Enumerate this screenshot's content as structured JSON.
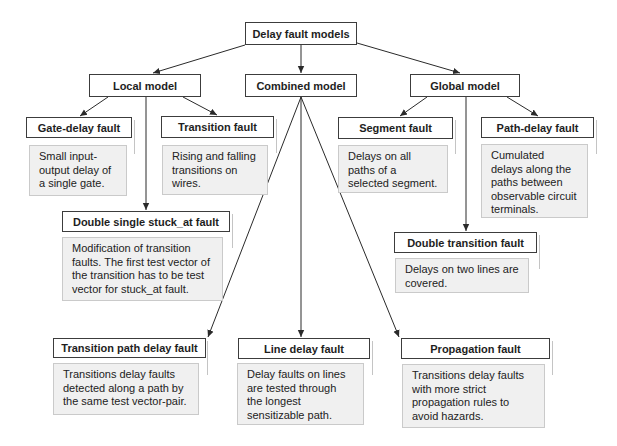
{
  "diagram": {
    "root": {
      "title": "Delay fault models"
    },
    "level1": {
      "local": {
        "title": "Local model"
      },
      "combined": {
        "title": "Combined model"
      },
      "global": {
        "title": "Global model"
      }
    },
    "faults": {
      "gate_delay": {
        "title": "Gate-delay fault",
        "parent": "Local model",
        "description_lines": [
          "Small input-",
          "output delay of",
          "a single gate."
        ]
      },
      "transition": {
        "title": "Transition fault",
        "parent": "Local model",
        "description_lines": [
          "Rising and falling",
          "transitions on",
          "wires."
        ]
      },
      "double_single_stuck_at": {
        "title": "Double single stuck_at fault",
        "parent": "Local model",
        "description_lines": [
          "Modification of transition",
          "faults. The first test vector of",
          "the transition has to be test",
          "vector for stuck_at fault."
        ]
      },
      "segment": {
        "title": "Segment fault",
        "parent": "Global model",
        "description_lines": [
          "Delays on all",
          "paths of a",
          "selected segment."
        ]
      },
      "path_delay": {
        "title": "Path-delay fault",
        "parent": "Global model",
        "description_lines": [
          "Cumulated",
          "delays along the",
          "paths between",
          "observable circuit",
          "terminals."
        ]
      },
      "double_transition": {
        "title": "Double transition fault",
        "parent": "Global model",
        "description_lines": [
          "Delays on two lines are",
          "covered."
        ]
      },
      "transition_path_delay": {
        "title": "Transition path delay fault",
        "parent": "Combined model",
        "description_lines": [
          "Transitions delay faults",
          "detected along a path by",
          "the same test vector-pair."
        ]
      },
      "line_delay": {
        "title": "Line delay fault",
        "parent": "Combined model",
        "description_lines": [
          "Delay faults on lines",
          "are tested through",
          "the longest",
          "sensitizable path."
        ]
      },
      "propagation": {
        "title": "Propagation fault",
        "parent": "Combined model",
        "description_lines": [
          "Transitions delay faults",
          "with more strict",
          "propagation rules to",
          "avoid hazards."
        ]
      }
    },
    "edges": [
      {
        "from": "Delay fault models",
        "to": "Local model"
      },
      {
        "from": "Delay fault models",
        "to": "Combined model"
      },
      {
        "from": "Delay fault models",
        "to": "Global model"
      },
      {
        "from": "Local model",
        "to": "Gate-delay fault"
      },
      {
        "from": "Local model",
        "to": "Transition fault"
      },
      {
        "from": "Local model",
        "to": "Double single stuck_at fault"
      },
      {
        "from": "Combined model",
        "to": "Transition path delay fault"
      },
      {
        "from": "Combined model",
        "to": "Line delay fault"
      },
      {
        "from": "Combined model",
        "to": "Propagation fault"
      },
      {
        "from": "Global model",
        "to": "Segment fault"
      },
      {
        "from": "Global model",
        "to": "Path-delay fault"
      },
      {
        "from": "Global model",
        "to": "Double transition fault"
      }
    ],
    "colors": {
      "title_border": "#3c3c3c",
      "desc_fill": "#f0f0f0",
      "desc_border": "#cacaca",
      "edge": "#2a2a2a"
    }
  }
}
